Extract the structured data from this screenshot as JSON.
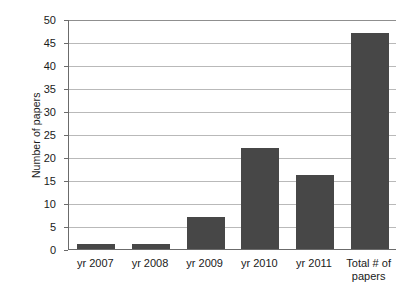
{
  "chart_data": {
    "type": "bar",
    "title": "",
    "xlabel": "",
    "ylabel": "Number of papers",
    "categories": [
      "yr 2007",
      "yr 2008",
      "yr 2009",
      "yr 2010",
      "yr 2011",
      "Total # of papers"
    ],
    "values": [
      1,
      1,
      7,
      22,
      16,
      47
    ],
    "ylim": [
      0,
      50
    ],
    "ytick_step": 5,
    "yticks": [
      "0",
      "5",
      "10",
      "15",
      "20",
      "25",
      "30",
      "35",
      "40",
      "45",
      "50"
    ],
    "grid": true,
    "legend": "none",
    "bar_color": "#474747",
    "gridline_color": "#b9b9b9",
    "axis_color": "#6b6b6b",
    "background": "#ffffff"
  },
  "axis": {
    "y_title": "Number of papers"
  },
  "categories_display": [
    {
      "line1": "yr 2007",
      "line2": ""
    },
    {
      "line1": "yr 2008",
      "line2": ""
    },
    {
      "line1": "yr 2009",
      "line2": ""
    },
    {
      "line1": "yr 2010",
      "line2": ""
    },
    {
      "line1": "yr 2011",
      "line2": ""
    },
    {
      "line1": "Total # of",
      "line2": "papers"
    }
  ]
}
